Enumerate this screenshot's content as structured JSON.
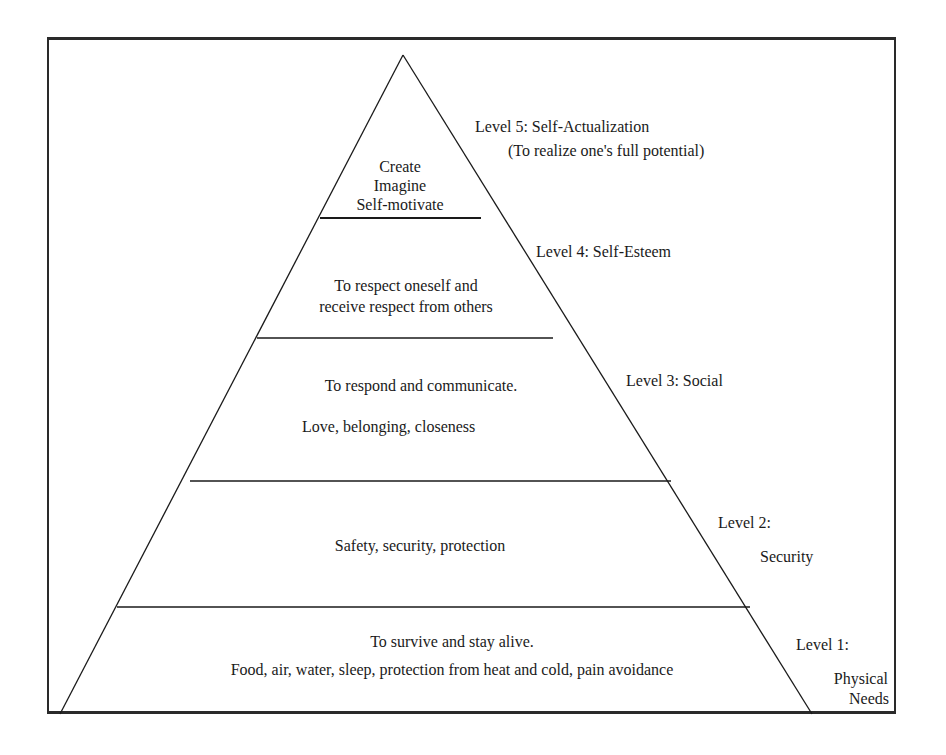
{
  "diagram": {
    "type": "pyramid",
    "levels": [
      {
        "level": 5,
        "label": "Level 5:  Self-Actualization",
        "sublabel": "(To realize one's full potential)",
        "content": [
          "Create",
          "Imagine",
          "Self-motivate"
        ]
      },
      {
        "level": 4,
        "label": "Level 4:  Self-Esteem",
        "content": [
          "To respect oneself and",
          "receive respect from others"
        ]
      },
      {
        "level": 3,
        "label": "Level 3:  Social",
        "content": [
          "To respond and communicate.",
          "Love, belonging, closeness"
        ]
      },
      {
        "level": 2,
        "label": "Level 2:",
        "sublabel": "Security",
        "content": [
          "Safety, security, protection"
        ]
      },
      {
        "level": 1,
        "label": "Level  1:",
        "sublabel": [
          "Physical",
          "Needs"
        ],
        "content": [
          "To survive and stay alive.",
          "Food, air, water, sleep, protection from heat and cold, pain avoidance"
        ]
      }
    ]
  }
}
